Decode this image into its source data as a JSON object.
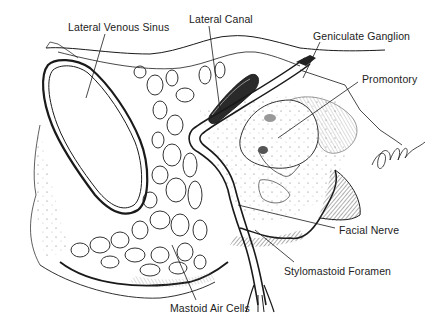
{
  "figure": {
    "signature": "Collins",
    "colors": {
      "line": "#1a1a1a",
      "background": "#ffffff",
      "label_text": "#222222"
    }
  },
  "labels": [
    {
      "id": "lateral-venous-sinus",
      "text": "Lateral Venous Sinus",
      "x": 68,
      "y": 21
    },
    {
      "id": "lateral-canal",
      "text": "Lateral Canal",
      "x": 189,
      "y": 13
    },
    {
      "id": "geniculate-ganglion",
      "text": "Geniculate Ganglion",
      "x": 313,
      "y": 30
    },
    {
      "id": "promontory",
      "text": "Promontory",
      "x": 362,
      "y": 73
    },
    {
      "id": "facial-nerve",
      "text": "Facial Nerve",
      "x": 339,
      "y": 224
    },
    {
      "id": "stylomastoid-foramen",
      "text": "Stylomastoid Foramen",
      "x": 284,
      "y": 265
    },
    {
      "id": "mastoid-air-cells",
      "text": "Mastoid Air Cells",
      "x": 170,
      "y": 302
    }
  ]
}
